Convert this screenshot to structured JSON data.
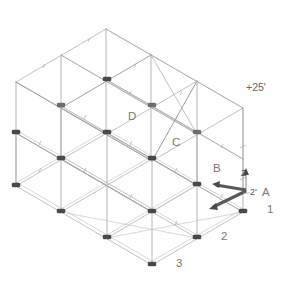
{
  "figure": {
    "projection": "isometric",
    "background_color": "#ffffff",
    "line_color": "#a8a8a8",
    "node_color": "#4a4a4a",
    "axis_color": "#595959"
  },
  "elevation": {
    "label": "+25'",
    "x": 246,
    "y": 91
  },
  "dimension": {
    "label": "2'",
    "x": 252,
    "y": 194
  },
  "grid_labels_letters": [
    {
      "label": "D",
      "x": 128,
      "y": 120
    },
    {
      "label": "C",
      "x": 172,
      "y": 146
    },
    {
      "label": "B",
      "x": 213,
      "y": 172
    },
    {
      "label": "A",
      "x": 262,
      "y": 196
    }
  ],
  "grid_labels_numbers": [
    {
      "label": "1",
      "x": 267,
      "y": 213
    },
    {
      "label": "2",
      "x": 221,
      "y": 240
    },
    {
      "label": "3",
      "x": 176,
      "y": 267
    }
  ],
  "axes": [
    {
      "name": "Z",
      "label": "Z",
      "x": 245,
      "y": 174,
      "direction": "up"
    },
    {
      "name": "X",
      "label": "",
      "x": 222,
      "y": 198,
      "direction": "down-left"
    },
    {
      "name": "Y",
      "label": "",
      "x": 228,
      "y": 212,
      "direction": "down-left"
    }
  ],
  "geometry": {
    "origin_x": 248,
    "origin_y": 190,
    "bays_x": 3,
    "bays_y": 3,
    "levels": 2,
    "step_x": 45.5,
    "step_y": 26.2,
    "column_height": 104
  },
  "notes": {
    "node_count_lower": 16,
    "node_count_mid": 9
  }
}
